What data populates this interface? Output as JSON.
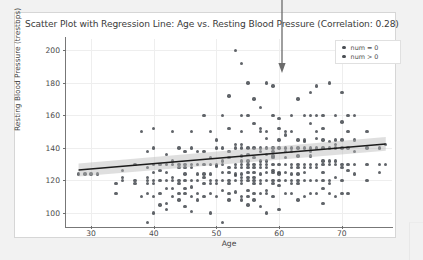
{
  "chart_data": {
    "type": "scatter",
    "title": "Scatter Plot with Regression Line: Age vs. Resting Blood Pressure (Correlation: 0.28)",
    "xlabel": "Age",
    "ylabel": "Resting Blood Pressure (trestbps)",
    "xlim": [
      26,
      78
    ],
    "ylim": [
      92,
      207
    ],
    "xticks": [
      30,
      40,
      50,
      60,
      70
    ],
    "yticks": [
      100,
      120,
      140,
      160,
      180,
      200
    ],
    "grid": true,
    "correlation": 0.28,
    "legend": {
      "position": "upper-right",
      "entries": [
        {
          "label": "num = 0",
          "color": "#4a4e54"
        },
        {
          "label": "num > 0",
          "color": "#4a4e54"
        }
      ]
    },
    "regression": {
      "type": "linear",
      "color": "#1b1b1b",
      "band_color": "#b9b9b9",
      "x_start": 28,
      "x_end": 77,
      "y_start": 126.5,
      "y_end": 142.5,
      "band_half_width_start": 4.0,
      "band_half_width_end": 4.2
    },
    "point_color": "#4a4e54",
    "points": [
      [
        28,
        124
      ],
      [
        29,
        124
      ],
      [
        30,
        124
      ],
      [
        31,
        124
      ],
      [
        34,
        118
      ],
      [
        34,
        112
      ],
      [
        35,
        120
      ],
      [
        35,
        126
      ],
      [
        35,
        122
      ],
      [
        37,
        130
      ],
      [
        37,
        120
      ],
      [
        37,
        118
      ],
      [
        38,
        150
      ],
      [
        38,
        110
      ],
      [
        39,
        118
      ],
      [
        39,
        120
      ],
      [
        39,
        138
      ],
      [
        39,
        128
      ],
      [
        39,
        122
      ],
      [
        39,
        112
      ],
      [
        39,
        94
      ],
      [
        40,
        140
      ],
      [
        40,
        152
      ],
      [
        40,
        130
      ],
      [
        40,
        125
      ],
      [
        40,
        120
      ],
      [
        40,
        118
      ],
      [
        40,
        110
      ],
      [
        40,
        100
      ],
      [
        41,
        130
      ],
      [
        41,
        126
      ],
      [
        41,
        120
      ],
      [
        41,
        112
      ],
      [
        41,
        105
      ],
      [
        42,
        136
      ],
      [
        42,
        130
      ],
      [
        42,
        125
      ],
      [
        42,
        120
      ],
      [
        42,
        115
      ],
      [
        42,
        106
      ],
      [
        42,
        102
      ],
      [
        43,
        150
      ],
      [
        43,
        132
      ],
      [
        43,
        130
      ],
      [
        43,
        122
      ],
      [
        43,
        120
      ],
      [
        43,
        115
      ],
      [
        43,
        110
      ],
      [
        44,
        140
      ],
      [
        44,
        130
      ],
      [
        44,
        128
      ],
      [
        44,
        120
      ],
      [
        44,
        118
      ],
      [
        44,
        112
      ],
      [
        44,
        108
      ],
      [
        45,
        138
      ],
      [
        45,
        130
      ],
      [
        45,
        128
      ],
      [
        45,
        124
      ],
      [
        45,
        120
      ],
      [
        45,
        115
      ],
      [
        45,
        112
      ],
      [
        45,
        104
      ],
      [
        46,
        150
      ],
      [
        46,
        140
      ],
      [
        46,
        130
      ],
      [
        46,
        128
      ],
      [
        46,
        120
      ],
      [
        46,
        116
      ],
      [
        46,
        110
      ],
      [
        46,
        101
      ],
      [
        47,
        138
      ],
      [
        47,
        130
      ],
      [
        47,
        124
      ],
      [
        47,
        120
      ],
      [
        47,
        112
      ],
      [
        47,
        108
      ],
      [
        48,
        160
      ],
      [
        48,
        138
      ],
      [
        48,
        130
      ],
      [
        48,
        124
      ],
      [
        48,
        122
      ],
      [
        48,
        118
      ],
      [
        48,
        110
      ],
      [
        49,
        150
      ],
      [
        49,
        134
      ],
      [
        49,
        130
      ],
      [
        49,
        124
      ],
      [
        49,
        120
      ],
      [
        49,
        118
      ],
      [
        49,
        112
      ],
      [
        49,
        100
      ],
      [
        50,
        145
      ],
      [
        50,
        140
      ],
      [
        50,
        130
      ],
      [
        50,
        129
      ],
      [
        50,
        120
      ],
      [
        50,
        118
      ],
      [
        50,
        110
      ],
      [
        51,
        160
      ],
      [
        51,
        140
      ],
      [
        51,
        132
      ],
      [
        51,
        130
      ],
      [
        51,
        125
      ],
      [
        51,
        120
      ],
      [
        51,
        114
      ],
      [
        51,
        94
      ],
      [
        52,
        172
      ],
      [
        52,
        152
      ],
      [
        52,
        138
      ],
      [
        52,
        134
      ],
      [
        52,
        128
      ],
      [
        52,
        125
      ],
      [
        52,
        120
      ],
      [
        52,
        118
      ],
      [
        52,
        112
      ],
      [
        52,
        108
      ],
      [
        53,
        200
      ],
      [
        53,
        142
      ],
      [
        53,
        140
      ],
      [
        53,
        130
      ],
      [
        53,
        128
      ],
      [
        53,
        124
      ],
      [
        53,
        123
      ],
      [
        53,
        120
      ],
      [
        53,
        113
      ],
      [
        54,
        192
      ],
      [
        54,
        160
      ],
      [
        54,
        150
      ],
      [
        54,
        142
      ],
      [
        54,
        140
      ],
      [
        54,
        135
      ],
      [
        54,
        132
      ],
      [
        54,
        130
      ],
      [
        54,
        128
      ],
      [
        54,
        124
      ],
      [
        54,
        122
      ],
      [
        54,
        120
      ],
      [
        54,
        118
      ],
      [
        54,
        110
      ],
      [
        54,
        108
      ],
      [
        55,
        180
      ],
      [
        55,
        160
      ],
      [
        55,
        140
      ],
      [
        55,
        136
      ],
      [
        55,
        132
      ],
      [
        55,
        130
      ],
      [
        55,
        128
      ],
      [
        55,
        125
      ],
      [
        55,
        122
      ],
      [
        55,
        120
      ],
      [
        55,
        114
      ],
      [
        55,
        110
      ],
      [
        55,
        105
      ],
      [
        56,
        170
      ],
      [
        56,
        155
      ],
      [
        56,
        140
      ],
      [
        56,
        134
      ],
      [
        56,
        130
      ],
      [
        56,
        128
      ],
      [
        56,
        125
      ],
      [
        56,
        122
      ],
      [
        56,
        120
      ],
      [
        56,
        118
      ],
      [
        56,
        112
      ],
      [
        56,
        108
      ],
      [
        57,
        165
      ],
      [
        57,
        152
      ],
      [
        57,
        150
      ],
      [
        57,
        140
      ],
      [
        57,
        138
      ],
      [
        57,
        132
      ],
      [
        57,
        130
      ],
      [
        57,
        128
      ],
      [
        57,
        124
      ],
      [
        57,
        120
      ],
      [
        57,
        118
      ],
      [
        57,
        112
      ],
      [
        57,
        104
      ],
      [
        58,
        180
      ],
      [
        58,
        150
      ],
      [
        58,
        146
      ],
      [
        58,
        140
      ],
      [
        58,
        136
      ],
      [
        58,
        132
      ],
      [
        58,
        130
      ],
      [
        58,
        128
      ],
      [
        58,
        125
      ],
      [
        58,
        120
      ],
      [
        58,
        114
      ],
      [
        58,
        112
      ],
      [
        58,
        100
      ],
      [
        59,
        178
      ],
      [
        59,
        160
      ],
      [
        59,
        140
      ],
      [
        59,
        138
      ],
      [
        59,
        135
      ],
      [
        59,
        134
      ],
      [
        59,
        130
      ],
      [
        59,
        126
      ],
      [
        59,
        125
      ],
      [
        59,
        120
      ],
      [
        59,
        118
      ],
      [
        59,
        110
      ],
      [
        60,
        158
      ],
      [
        60,
        152
      ],
      [
        60,
        145
      ],
      [
        60,
        140
      ],
      [
        60,
        130
      ],
      [
        60,
        125
      ],
      [
        60,
        124
      ],
      [
        60,
        120
      ],
      [
        60,
        117
      ],
      [
        60,
        102
      ],
      [
        61,
        150
      ],
      [
        61,
        148
      ],
      [
        61,
        140
      ],
      [
        61,
        138
      ],
      [
        61,
        134
      ],
      [
        61,
        130
      ],
      [
        61,
        125
      ],
      [
        61,
        120
      ],
      [
        61,
        112
      ],
      [
        62,
        160
      ],
      [
        62,
        150
      ],
      [
        62,
        140
      ],
      [
        62,
        138
      ],
      [
        62,
        130
      ],
      [
        62,
        128
      ],
      [
        62,
        124
      ],
      [
        62,
        120
      ],
      [
        62,
        118
      ],
      [
        62,
        112
      ],
      [
        63,
        170
      ],
      [
        63,
        145
      ],
      [
        63,
        140
      ],
      [
        63,
        135
      ],
      [
        63,
        130
      ],
      [
        63,
        128
      ],
      [
        63,
        124
      ],
      [
        63,
        120
      ],
      [
        63,
        118
      ],
      [
        63,
        108
      ],
      [
        64,
        160
      ],
      [
        64,
        145
      ],
      [
        64,
        144
      ],
      [
        64,
        140
      ],
      [
        64,
        130
      ],
      [
        64,
        128
      ],
      [
        64,
        125
      ],
      [
        64,
        120
      ],
      [
        64,
        110
      ],
      [
        65,
        174
      ],
      [
        65,
        160
      ],
      [
        65,
        155
      ],
      [
        65,
        140
      ],
      [
        65,
        138
      ],
      [
        65,
        135
      ],
      [
        65,
        130
      ],
      [
        65,
        128
      ],
      [
        65,
        120
      ],
      [
        65,
        112
      ],
      [
        66,
        178
      ],
      [
        66,
        160
      ],
      [
        66,
        150
      ],
      [
        66,
        146
      ],
      [
        66,
        140
      ],
      [
        66,
        130
      ],
      [
        66,
        128
      ],
      [
        66,
        120
      ],
      [
        66,
        112
      ],
      [
        67,
        160
      ],
      [
        67,
        152
      ],
      [
        67,
        145
      ],
      [
        67,
        140
      ],
      [
        67,
        132
      ],
      [
        67,
        130
      ],
      [
        67,
        125
      ],
      [
        67,
        120
      ],
      [
        67,
        115
      ],
      [
        67,
        106
      ],
      [
        68,
        180
      ],
      [
        68,
        144
      ],
      [
        68,
        140
      ],
      [
        68,
        132
      ],
      [
        68,
        130
      ],
      [
        68,
        120
      ],
      [
        68,
        118
      ],
      [
        68,
        112
      ],
      [
        69,
        160
      ],
      [
        69,
        145
      ],
      [
        69,
        142
      ],
      [
        69,
        140
      ],
      [
        69,
        132
      ],
      [
        69,
        130
      ],
      [
        69,
        122
      ],
      [
        69,
        110
      ],
      [
        70,
        174
      ],
      [
        70,
        156
      ],
      [
        70,
        145
      ],
      [
        70,
        140
      ],
      [
        70,
        130
      ],
      [
        70,
        128
      ],
      [
        70,
        120
      ],
      [
        70,
        112
      ],
      [
        71,
        160
      ],
      [
        71,
        150
      ],
      [
        71,
        140
      ],
      [
        71,
        130
      ],
      [
        71,
        126
      ],
      [
        71,
        112
      ],
      [
        72,
        160
      ],
      [
        72,
        145
      ],
      [
        72,
        138
      ],
      [
        72,
        130
      ],
      [
        72,
        124
      ],
      [
        74,
        150
      ],
      [
        74,
        140
      ],
      [
        74,
        130
      ],
      [
        74,
        120
      ],
      [
        76,
        140
      ],
      [
        76,
        130
      ],
      [
        76,
        125
      ],
      [
        77,
        142
      ],
      [
        77,
        130
      ]
    ]
  },
  "annotation": {
    "arrow": {
      "name": "downward-pointer-arrow",
      "color": "#6b6b6b",
      "x": 278,
      "y_start": 0,
      "y_end": 72
    }
  }
}
